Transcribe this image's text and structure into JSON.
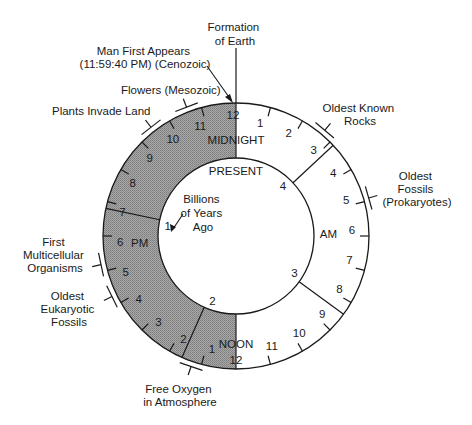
{
  "diagram": {
    "type": "geologic-time-clock",
    "center": [
      236,
      236
    ],
    "outer_radius": 133,
    "inner_radius": 78,
    "colors": {
      "shade": "#9a9a9a",
      "shade_dark": "#7a7a7a",
      "line": "#1a1a1a",
      "background": "#ffffff"
    },
    "clock_labels": {
      "midnight": "MIDNIGHT",
      "noon": "NOON",
      "am": "AM",
      "pm": "PM",
      "present": "PRESENT"
    },
    "hour_ticks": [
      {
        "hour": 0,
        "label": "12"
      },
      {
        "hour": 1,
        "label": "1"
      },
      {
        "hour": 2,
        "label": "2"
      },
      {
        "hour": 3,
        "label": "3"
      },
      {
        "hour": 4,
        "label": "4"
      },
      {
        "hour": 5,
        "label": "5"
      },
      {
        "hour": 6,
        "label": "6"
      },
      {
        "hour": 7,
        "label": "7"
      },
      {
        "hour": 8,
        "label": "8"
      },
      {
        "hour": 9,
        "label": "9"
      },
      {
        "hour": 10,
        "label": "10"
      },
      {
        "hour": 11,
        "label": "11"
      },
      {
        "hour": 12,
        "label": "12"
      },
      {
        "hour": 13,
        "label": "1"
      },
      {
        "hour": 14,
        "label": "2"
      },
      {
        "hour": 15,
        "label": "3"
      },
      {
        "hour": 16,
        "label": "4"
      },
      {
        "hour": 17,
        "label": "5"
      },
      {
        "hour": 18,
        "label": "6"
      },
      {
        "hour": 19,
        "label": "7"
      },
      {
        "hour": 20,
        "label": "8"
      },
      {
        "hour": 21,
        "label": "9"
      },
      {
        "hour": 22,
        "label": "10"
      },
      {
        "hour": 23,
        "label": "11"
      }
    ],
    "billion_years_markers": [
      {
        "label": "1",
        "angle": 282
      },
      {
        "label": "2",
        "angle": 204
      },
      {
        "label": "3",
        "angle": 126
      },
      {
        "label": "4",
        "angle": 47
      }
    ],
    "inner_caption": "Billions of Years Ago",
    "inner_caption_lines": [
      "Billions",
      "of Years",
      "Ago"
    ],
    "events": [
      {
        "id": "formation",
        "lines": [
          "Formation",
          "of Earth"
        ]
      },
      {
        "id": "man",
        "lines": [
          "Man First Appears",
          "(11:59:40 PM) (Cenozoic)"
        ]
      },
      {
        "id": "flowers",
        "lines": [
          "Flowers (Mesozoic)"
        ]
      },
      {
        "id": "plants",
        "lines": [
          "Plants Invade Land"
        ]
      },
      {
        "id": "multicellular",
        "lines": [
          "First",
          "Multicellular",
          "Organisms"
        ]
      },
      {
        "id": "eukaryotic",
        "lines": [
          "Oldest",
          "Eukaryotic",
          "Fossils"
        ]
      },
      {
        "id": "oxygen",
        "lines": [
          "Free Oxygen",
          "in Atmosphere"
        ]
      },
      {
        "id": "rocks",
        "lines": [
          "Oldest Known",
          "Rocks"
        ]
      },
      {
        "id": "fossils",
        "lines": [
          "Oldest",
          "Fossils",
          "(Prokaryotes)"
        ]
      }
    ]
  }
}
